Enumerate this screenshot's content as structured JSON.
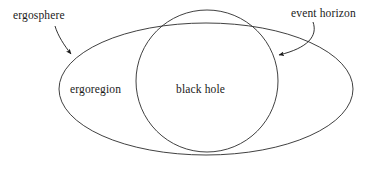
{
  "figure": {
    "background_color": "#ffffff",
    "stroke_color": "#2b2b2b",
    "text_color": "#1a1a1a",
    "width": 386,
    "height": 170
  },
  "labels": {
    "ergosphere": "ergosphere",
    "event_horizon": "event horizon",
    "ergoregion": "ergoregion",
    "black_hole": "black hole"
  },
  "shapes": {
    "ergosphere_ellipse": {
      "name": "ergosphere",
      "type": "ellipse",
      "cx": 206,
      "cy": 89,
      "rx": 147,
      "ry": 66
    },
    "event_horizon_circle": {
      "name": "event horizon",
      "type": "circle",
      "cx": 207,
      "cy": 81,
      "r": 71
    }
  },
  "annotations": [
    {
      "name": "ergosphere-arrow",
      "label": "ergosphere",
      "from": [
        55,
        26
      ],
      "to": [
        72,
        57
      ],
      "style": "curved-arrow"
    },
    {
      "name": "event-horizon-arrow",
      "label": "event horizon",
      "from": [
        313,
        22
      ],
      "to": [
        274,
        57
      ],
      "style": "curved-arrow"
    }
  ]
}
